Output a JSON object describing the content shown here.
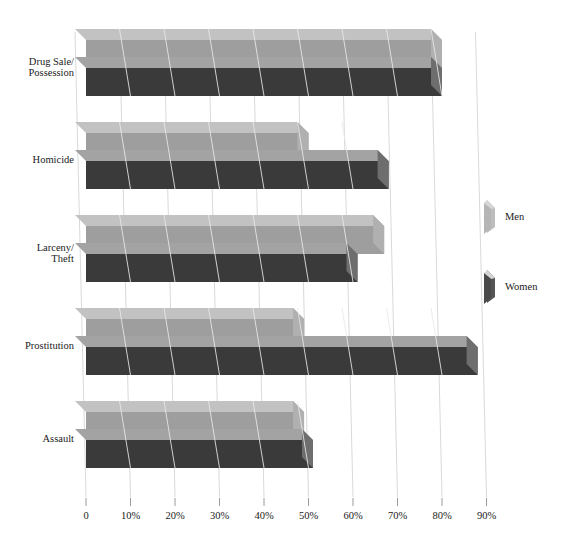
{
  "chart_data": {
    "type": "bar",
    "title": "",
    "subtitle": "",
    "xlabel": "",
    "ylabel": "",
    "orientation": "horizontal",
    "style": "3d-bar",
    "grid": true,
    "grid_axis": "x",
    "legend_position": "right",
    "xlim": [
      0,
      90
    ],
    "categories": [
      "Drug Sale/\nPossession",
      "Homicide",
      "Larceny/\nTheft",
      "Prostitution",
      "Assault"
    ],
    "category_lines": [
      [
        "Drug Sale/",
        "Possession"
      ],
      [
        "Homicide"
      ],
      [
        "Larceny/",
        "Theft"
      ],
      [
        "Prostitution"
      ],
      [
        "Assault"
      ]
    ],
    "tick_labels": [
      "0",
      "10%",
      "20%",
      "30%",
      "40%",
      "50%",
      "60%",
      "70%",
      "80%",
      "90%"
    ],
    "tick_values": [
      0,
      10,
      20,
      30,
      40,
      50,
      60,
      70,
      80,
      90
    ],
    "series": [
      {
        "name": "Men",
        "color": "#9e9e9e",
        "top_color": "#c2c2c2",
        "side_color": "#b0b0b0",
        "values": [
          80,
          50,
          67,
          49,
          49
        ]
      },
      {
        "name": "Women",
        "color": "#3a3a3a",
        "top_color": "#a3a3a3",
        "side_color": "#6e6e6e",
        "values": [
          80,
          68,
          61,
          88,
          51
        ]
      }
    ],
    "legend": [
      {
        "label": "Men",
        "color": "#bdbdbd"
      },
      {
        "label": "Women",
        "color": "#555555"
      }
    ]
  },
  "colors": {
    "background": "#ffffff",
    "gridline": "#d9d9d9",
    "axis_text": "#1a1a1a",
    "men_front": "#9e9e9e",
    "men_top": "#c2c2c2",
    "women_front": "#3a3a3a",
    "women_top": "#a3a3a3"
  }
}
